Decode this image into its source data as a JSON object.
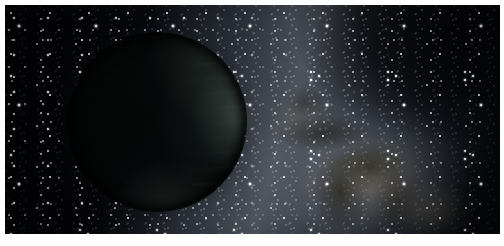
{
  "page": {
    "background_color": "#ffffff",
    "width": 504,
    "height": 246
  },
  "artwork": {
    "name": "rogue-planet-milky-way-illustration",
    "kind": "artist-impression",
    "alt_text": "Artist's impression of a dark, unlit planet silhouetted against the dense star clouds of the Milky Way",
    "frame": {
      "x": 5,
      "y": 5,
      "width": 495,
      "height": 229
    },
    "palette": {
      "space_black": "#04060a",
      "deep_void": "#010204",
      "star_white": "#ffffff",
      "star_blue_white": "#e2e6ee",
      "band_gray": "#6a7078",
      "band_highlight": "#9a9ea6",
      "dust_brown": "#5c523 8",
      "dust_olive": "#6e6544",
      "planet_shadow": "#020303",
      "planet_limb_green": "#76887e",
      "planet_rim_teal": "#60746e"
    },
    "planet": {
      "name": "dark-planet",
      "center_x": 152,
      "center_y": 117,
      "diameter": 178,
      "illumination": "thin crescent on right limb",
      "light_direction": "right"
    },
    "milky_way": {
      "name": "milky-way-band",
      "orientation": "diagonal, upper-left to lower-right",
      "brightest_region_x": 352,
      "brightest_region_y": 172,
      "dust_lane_count": 5
    },
    "star_layers": [
      {
        "name": "stars-haze",
        "density": "very-high",
        "size": "sub-pixel"
      },
      {
        "name": "stars-mid",
        "density": "high",
        "size": "small"
      },
      {
        "name": "stars-bright",
        "density": "low",
        "size": "large"
      },
      {
        "name": "stars-left",
        "density": "medium",
        "size": "small"
      }
    ]
  }
}
